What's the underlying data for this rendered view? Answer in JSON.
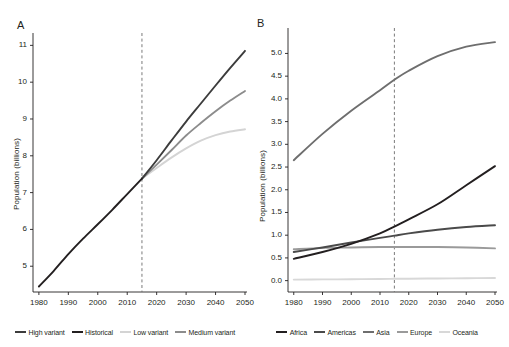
{
  "figure": {
    "width": 502,
    "height": 347,
    "background": "#ffffff"
  },
  "panels": [
    {
      "id": "A",
      "label": "A",
      "ylabel": "Population (billions)",
      "xlabel": "",
      "ytick_labels": [
        "5",
        "6",
        "7",
        "8",
        "9",
        "10",
        "11"
      ],
      "xtick_labels": [
        "1980",
        "1990",
        "2000",
        "2010",
        "2020",
        "2030",
        "2040",
        "2050"
      ],
      "projection_marker_year": 2015,
      "legend": [
        {
          "label": "High variant",
          "color": "#3c3c3c"
        },
        {
          "label": "Historical",
          "color": "#231f20"
        },
        {
          "label": "Low variant",
          "color": "#d4d4d4"
        },
        {
          "label": "Medium variant",
          "color": "#8c8c8c"
        }
      ]
    },
    {
      "id": "B",
      "label": "B",
      "ylabel": "Population (billions)",
      "xlabel": "",
      "ytick_labels": [
        "0.0",
        "0.5",
        "1.0",
        "1.5",
        "2.0",
        "2.5",
        "3.0",
        "3.5",
        "4.0",
        "4.5",
        "5.0"
      ],
      "xtick_labels": [
        "1980",
        "1990",
        "2000",
        "2010",
        "2020",
        "2030",
        "2040",
        "2050"
      ],
      "projection_marker_year": 2015,
      "legend": [
        {
          "label": "Africa",
          "color": "#231f20"
        },
        {
          "label": "Americas",
          "color": "#4a4a4a"
        },
        {
          "label": "Asia",
          "color": "#6e6e6e"
        },
        {
          "label": "Europe",
          "color": "#9a9a9a"
        },
        {
          "label": "Oceania",
          "color": "#d8d8d8"
        }
      ]
    }
  ],
  "chart_data": [
    {
      "type": "line",
      "panel": "A",
      "title": "",
      "xlabel": "",
      "ylabel": "Population (billions)",
      "xlim": [
        1978,
        2050
      ],
      "ylim": [
        4.3,
        11.2
      ],
      "xticks": [
        1980,
        1990,
        2000,
        2010,
        2020,
        2030,
        2040,
        2050
      ],
      "yticks": [
        5,
        6,
        7,
        8,
        9,
        10,
        11
      ],
      "grid": false,
      "legend_position": "bottom",
      "annotations": [
        {
          "type": "vline",
          "x": 2015,
          "style": "dashed",
          "color": "#6b6b6b",
          "label": ""
        }
      ],
      "series": [
        {
          "name": "Historical",
          "color": "#231f20",
          "x": [
            1980,
            1985,
            1990,
            1995,
            2000,
            2005,
            2010,
            2015
          ],
          "values": [
            4.45,
            4.87,
            5.33,
            5.75,
            6.14,
            6.54,
            6.96,
            7.38
          ]
        },
        {
          "name": "High variant",
          "color": "#3c3c3c",
          "x": [
            2015,
            2020,
            2025,
            2030,
            2035,
            2040,
            2045,
            2050
          ],
          "values": [
            7.38,
            7.88,
            8.41,
            8.93,
            9.42,
            9.91,
            10.39,
            10.85
          ]
        },
        {
          "name": "Medium variant",
          "color": "#8c8c8c",
          "x": [
            2015,
            2020,
            2025,
            2030,
            2035,
            2040,
            2045,
            2050
          ],
          "values": [
            7.38,
            7.76,
            8.15,
            8.55,
            8.89,
            9.21,
            9.5,
            9.76
          ]
        },
        {
          "name": "Low variant",
          "color": "#d4d4d4",
          "x": [
            2015,
            2020,
            2025,
            2030,
            2035,
            2040,
            2045,
            2050
          ],
          "values": [
            7.38,
            7.67,
            7.95,
            8.2,
            8.41,
            8.56,
            8.66,
            8.72
          ]
        }
      ]
    },
    {
      "type": "line",
      "panel": "B",
      "title": "",
      "xlabel": "",
      "ylabel": "Population (billions)",
      "xlim": [
        1978,
        2050
      ],
      "ylim": [
        -0.25,
        5.45
      ],
      "xticks": [
        1980,
        1990,
        2000,
        2010,
        2020,
        2030,
        2040,
        2050
      ],
      "yticks": [
        0.0,
        0.5,
        1.0,
        1.5,
        2.0,
        2.5,
        3.0,
        3.5,
        4.0,
        4.5,
        5.0
      ],
      "grid": false,
      "legend_position": "bottom",
      "annotations": [
        {
          "type": "vline",
          "x": 2015,
          "style": "dashed",
          "color": "#6b6b6b",
          "label": ""
        }
      ],
      "x": [
        1980,
        1990,
        2000,
        2010,
        2015,
        2020,
        2030,
        2040,
        2050
      ],
      "series": [
        {
          "name": "Africa",
          "color": "#231f20",
          "values": [
            0.48,
            0.63,
            0.81,
            1.04,
            1.19,
            1.35,
            1.68,
            2.1,
            2.52
          ]
        },
        {
          "name": "Americas",
          "color": "#4a4a4a",
          "values": [
            0.63,
            0.73,
            0.84,
            0.94,
            0.99,
            1.04,
            1.12,
            1.18,
            1.22
          ]
        },
        {
          "name": "Asia",
          "color": "#6e6e6e",
          "values": [
            2.65,
            3.23,
            3.74,
            4.19,
            4.42,
            4.62,
            4.94,
            5.15,
            5.25
          ]
        },
        {
          "name": "Europe",
          "color": "#9a9a9a",
          "values": [
            0.69,
            0.72,
            0.73,
            0.74,
            0.74,
            0.74,
            0.74,
            0.73,
            0.71
          ]
        },
        {
          "name": "Oceania",
          "color": "#d8d8d8",
          "values": [
            0.023,
            0.027,
            0.031,
            0.037,
            0.04,
            0.043,
            0.048,
            0.054,
            0.059
          ]
        }
      ]
    }
  ]
}
